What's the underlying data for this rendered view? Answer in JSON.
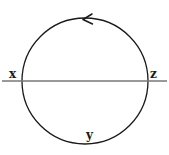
{
  "figure": {
    "type": "circle-orientation-diagram",
    "background_color": "#ffffff",
    "stroke_color": "#1a1a1a",
    "chord_color": "#777777",
    "labels": {
      "left": "x",
      "right": "z",
      "bottom": "y"
    },
    "arrow": {
      "name": "counterclockwise-arrow",
      "direction": "counterclockwise",
      "glyph": "<",
      "position": "top-of-circle"
    },
    "circle": {
      "center_x": 85,
      "center_y": 81,
      "radius": 63
    },
    "chord": {
      "y": 81,
      "x_start": 2,
      "x_end": 167
    }
  }
}
